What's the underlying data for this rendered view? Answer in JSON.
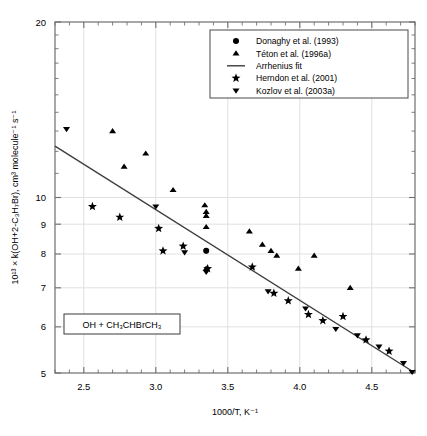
{
  "chart_data": {
    "type": "scatter",
    "title": "",
    "xlabel": "1000/T, K⁻¹",
    "ylabel": "10¹³ × k(OH+2-C₃H₇Br), cm³ molecule⁻¹ s⁻¹",
    "xlim": [
      2.3,
      4.8
    ],
    "ylim": [
      5,
      20
    ],
    "yscale": "log",
    "xscale": "linear",
    "grid": true,
    "legend_position": "top-right",
    "xticks": [
      2.5,
      3.0,
      3.5,
      4.0,
      4.5
    ],
    "xtick_labels": [
      "2.5",
      "3.0",
      "3.5",
      "4.0",
      "4.5"
    ],
    "xminor_step": 0.1,
    "yticks": [
      5,
      6,
      7,
      8,
      9,
      10,
      20
    ],
    "ytick_labels": [
      "5",
      "6",
      "7",
      "8",
      "9",
      "10",
      "20"
    ],
    "annotation": "OH + CH₃CHBrCH₃",
    "series": [
      {
        "name": "Donaghy et al. (1993)",
        "marker": "circle",
        "color": "#000000",
        "points": [
          [
            3.35,
            8.1
          ]
        ]
      },
      {
        "name": "Téton et al. (1996a)",
        "marker": "triangle-up",
        "color": "#000000",
        "points": [
          [
            2.7,
            13.0
          ],
          [
            2.78,
            11.3
          ],
          [
            2.93,
            11.9
          ],
          [
            3.12,
            10.3
          ],
          [
            3.34,
            9.7
          ],
          [
            3.35,
            9.45
          ],
          [
            3.35,
            9.3
          ],
          [
            3.35,
            8.9
          ],
          [
            3.35,
            7.55
          ],
          [
            3.65,
            8.75
          ],
          [
            3.74,
            8.3
          ],
          [
            3.8,
            8.1
          ],
          [
            3.84,
            7.95
          ],
          [
            3.99,
            7.55
          ],
          [
            4.1,
            7.95
          ],
          [
            4.35,
            7.0
          ]
        ]
      },
      {
        "name": "Herndon et al. (2001)",
        "marker": "star",
        "color": "#000000",
        "points": [
          [
            2.56,
            9.65
          ],
          [
            2.75,
            9.25
          ],
          [
            3.02,
            8.85
          ],
          [
            3.05,
            8.1
          ],
          [
            3.19,
            8.25
          ],
          [
            3.36,
            7.55
          ],
          [
            3.67,
            7.6
          ],
          [
            3.82,
            6.85
          ],
          [
            3.92,
            6.65
          ],
          [
            4.06,
            6.3
          ],
          [
            4.16,
            6.15
          ],
          [
            4.3,
            6.25
          ],
          [
            4.46,
            5.7
          ],
          [
            4.62,
            5.45
          ]
        ]
      },
      {
        "name": "Kozlov et al. (2003a)",
        "marker": "triangle-down",
        "color": "#000000",
        "points": [
          [
            2.38,
            13.1
          ],
          [
            3.0,
            9.65
          ],
          [
            3.2,
            8.05
          ],
          [
            3.35,
            7.45
          ],
          [
            3.78,
            6.9
          ],
          [
            4.04,
            6.45
          ],
          [
            4.25,
            5.95
          ],
          [
            4.4,
            5.8
          ],
          [
            4.55,
            5.55
          ],
          [
            4.72,
            5.2
          ],
          [
            4.78,
            5.02
          ]
        ]
      }
    ],
    "fit": {
      "name": "Arrhenius fit",
      "style": "line",
      "color": "#3b3b3b",
      "endpoints": [
        [
          2.3,
          12.25
        ],
        [
          4.79,
          5.02
        ]
      ]
    },
    "legend_entries": [
      {
        "label": "Donaghy et al. (1993)",
        "marker": "circle"
      },
      {
        "label": "Téton et al. (1996a)",
        "marker": "triangle-up"
      },
      {
        "label": "Arrhenius fit",
        "marker": "line"
      },
      {
        "label": "Herndon et al. (2001)",
        "marker": "star"
      },
      {
        "label": "Kozlov et al. (2003a)",
        "marker": "triangle-down"
      }
    ]
  },
  "axis": {
    "x_title": "1000/T, K⁻¹",
    "y_title": "10¹³ × k(OH+2-C₃H₇Br), cm³ molecule⁻¹ s⁻¹"
  },
  "annotation": {
    "text": "OH + CH₃CHBrCH₃"
  },
  "colors": {
    "marker": "#000000",
    "fit_line": "#3b3b3b",
    "axis": "#6e6e6e",
    "grid": "#d9d9d9",
    "background": "#ffffff"
  }
}
